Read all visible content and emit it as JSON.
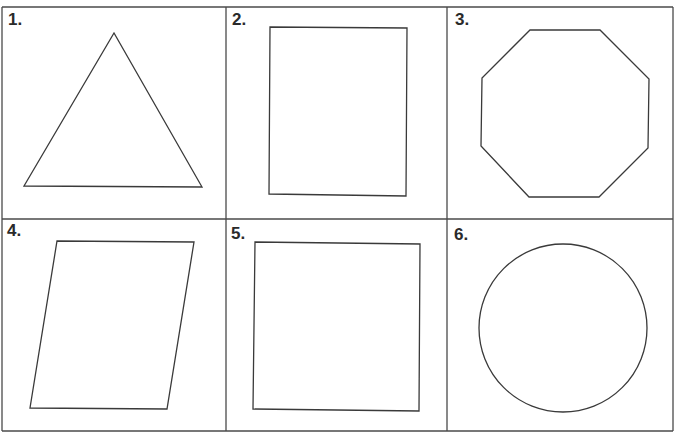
{
  "colors": {
    "stroke": "#3a3a3a",
    "grid": "#4a4a4a",
    "background": "#ffffff"
  },
  "grid": {
    "rows": 2,
    "columns": 3,
    "left": 2,
    "right": 673,
    "top": 7,
    "middle_y": 219,
    "bottom": 431,
    "col_x": [
      2,
      226,
      447,
      673
    ]
  },
  "cells": [
    {
      "number": "1.",
      "label_x": 8,
      "label_y": 11,
      "shape": "triangle",
      "points": "24,186 114,33 202,187"
    },
    {
      "number": "2.",
      "label_x": 232,
      "label_y": 11,
      "shape": "rectangle",
      "points": "270,27 407,28 406,196 269,194"
    },
    {
      "number": "3.",
      "label_x": 455,
      "label_y": 11,
      "shape": "octagon",
      "points": "530,30 600,30 649,79 648,148 599,197 529,197 481,146 482,78"
    },
    {
      "number": "4.",
      "label_x": 7,
      "label_y": 222,
      "shape": "parallelogram",
      "points": "57,241 194,242 167,409 30,408"
    },
    {
      "number": "5.",
      "label_x": 231,
      "label_y": 225,
      "shape": "square",
      "points": "255,242 420,244 419,411 253,409"
    },
    {
      "number": "6.",
      "label_x": 454,
      "label_y": 226,
      "shape": "circle",
      "cx": 563,
      "cy": 328,
      "r": 84
    }
  ]
}
